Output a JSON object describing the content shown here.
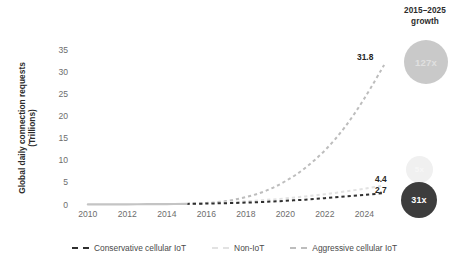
{
  "header": {
    "growth_line1": "2015–2025",
    "growth_line2": "growth"
  },
  "growth_badges": [
    {
      "name": "aggressive",
      "value": "127x",
      "color": "#c9c9c9",
      "text_color": "#e0e0e0"
    },
    {
      "name": "non-iot",
      "value": "5x",
      "color": "#f0f0f0",
      "text_color": "#f7f7f7"
    },
    {
      "name": "conservative",
      "value": "31x",
      "color": "#3d3d3d",
      "text_color": "#ffffff"
    }
  ],
  "axis": {
    "y_title_line1": "Global daily connection requests",
    "y_title_line2": "(Trillions)"
  },
  "end_labels": {
    "aggressive": "31.8",
    "non_iot": "4.4",
    "conservative": "2.7"
  },
  "legend": [
    {
      "label": "Conservative cellular IoT",
      "color": "#2f2f2f"
    },
    {
      "label": "Non-IoT",
      "color": "#e2e2e2"
    },
    {
      "label": "Aggressive cellular IoT",
      "color": "#bdbdbd"
    }
  ],
  "chart_data": {
    "type": "line",
    "title": "",
    "xlabel": "",
    "ylabel": "Global daily connection requests (Trillions)",
    "xlim": [
      2009.4,
      2025.6
    ],
    "ylim": [
      0,
      37
    ],
    "yticks": [
      0,
      5,
      10,
      15,
      20,
      25,
      30,
      35
    ],
    "ytick_labels": [
      "0",
      "5",
      "10",
      "15",
      "20",
      "25",
      "30",
      "35"
    ],
    "xticks": [
      2010,
      2012,
      2014,
      2016,
      2018,
      2020,
      2022,
      2024
    ],
    "xtick_labels": [
      "2010",
      "2012",
      "2014",
      "2016",
      "2018",
      "2020",
      "2022",
      "2024"
    ],
    "grid": false,
    "legend_position": "bottom",
    "historical_range": [
      2010,
      2015
    ],
    "forecast_range": [
      2015,
      2025
    ],
    "x": [
      2010,
      2011,
      2012,
      2013,
      2014,
      2015,
      2016,
      2017,
      2018,
      2019,
      2020,
      2021,
      2022,
      2023,
      2024,
      2025
    ],
    "series": [
      {
        "name": "Aggressive cellular IoT",
        "color": "#bdbdbd",
        "style": "dashed",
        "end_value": 31.8,
        "growth": "127x",
        "values": [
          0.12,
          0.14,
          0.16,
          0.19,
          0.22,
          0.25,
          0.45,
          0.9,
          1.8,
          3.2,
          5.4,
          8.4,
          12.4,
          17.6,
          24.2,
          31.8
        ]
      },
      {
        "name": "Non-IoT",
        "color": "#e2e2e2",
        "style": "dashed",
        "end_value": 4.4,
        "growth": "5x",
        "values": [
          0.12,
          0.14,
          0.16,
          0.19,
          0.22,
          0.25,
          0.4,
          0.6,
          0.85,
          1.15,
          1.5,
          1.95,
          2.45,
          3.05,
          3.7,
          4.4
        ]
      },
      {
        "name": "Conservative cellular IoT",
        "color": "#2f2f2f",
        "style": "dashed",
        "end_value": 2.7,
        "growth": "31x",
        "values": [
          0.12,
          0.14,
          0.16,
          0.19,
          0.22,
          0.25,
          0.32,
          0.42,
          0.55,
          0.72,
          0.95,
          1.22,
          1.55,
          1.95,
          2.3,
          2.7
        ]
      }
    ],
    "historical_series": {
      "name": "Historical",
      "color": "#c4c4c4",
      "style": "solid",
      "x": [
        2010,
        2011,
        2012,
        2013,
        2014,
        2015
      ],
      "values": [
        0.12,
        0.14,
        0.16,
        0.19,
        0.22,
        0.25
      ]
    }
  }
}
